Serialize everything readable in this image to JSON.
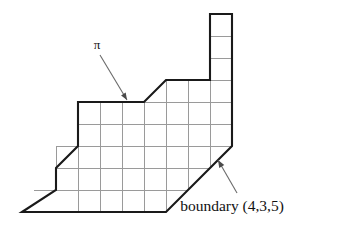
{
  "figure": {
    "background_color": "#ffffff",
    "grid_line_color": "#9a9a9a",
    "boundary_color": "#1a1a1a",
    "arrow_color": "#6a6a6a",
    "text_color": "#111111",
    "grid": {
      "cell_width": 22,
      "cell_height": 22,
      "origin_x": 56,
      "origin_y": 102
    },
    "labels": {
      "pi": "π",
      "boundary": "boundary (4,3,5)"
    },
    "annotations": [
      {
        "name": "pi-annotation",
        "text": "π",
        "text_x": 97,
        "text_y": 49,
        "arrow_from_x": 100,
        "arrow_from_y": 55,
        "arrow_to_x": 127,
        "arrow_to_y": 100
      },
      {
        "name": "boundary-annotation",
        "text": "boundary (4,3,5)",
        "text_x": 232,
        "text_y": 211,
        "arrow_from_x": 237,
        "arrow_from_y": 193,
        "arrow_to_x": 218,
        "arrow_to_y": 160
      }
    ],
    "boundary_polygon": [
      [
        22,
        212
      ],
      [
        56,
        190
      ],
      [
        56,
        168
      ],
      [
        78,
        146
      ],
      [
        78,
        102
      ],
      [
        144,
        102
      ],
      [
        166,
        80
      ],
      [
        210,
        80
      ],
      [
        210,
        14
      ],
      [
        232,
        14
      ],
      [
        232,
        146
      ],
      [
        166,
        212
      ],
      [
        22,
        212
      ]
    ],
    "grid_lines": [
      {
        "name": "h-row-0",
        "x1": 210,
        "y1": 14,
        "x2": 232,
        "y2": 14
      },
      {
        "name": "h-row-1",
        "x1": 210,
        "y1": 36,
        "x2": 232,
        "y2": 36
      },
      {
        "name": "h-row-2",
        "x1": 210,
        "y1": 58,
        "x2": 232,
        "y2": 58
      },
      {
        "name": "h-row-3",
        "x1": 166,
        "y1": 80,
        "x2": 232,
        "y2": 80
      },
      {
        "name": "h-row-4",
        "x1": 78,
        "y1": 102,
        "x2": 232,
        "y2": 102
      },
      {
        "name": "h-row-5",
        "x1": 78,
        "y1": 124,
        "x2": 232,
        "y2": 124
      },
      {
        "name": "h-row-6",
        "x1": 56,
        "y1": 146,
        "x2": 232,
        "y2": 146
      },
      {
        "name": "h-row-7",
        "x1": 56,
        "y1": 168,
        "x2": 210,
        "y2": 168
      },
      {
        "name": "h-row-8",
        "x1": 34,
        "y1": 190,
        "x2": 188,
        "y2": 190
      },
      {
        "name": "h-row-9",
        "x1": 22,
        "y1": 212,
        "x2": 166,
        "y2": 212
      },
      {
        "name": "v-col-0",
        "x1": 56,
        "y1": 146,
        "x2": 56,
        "y2": 190
      },
      {
        "name": "v-col-1",
        "x1": 78,
        "y1": 102,
        "x2": 78,
        "y2": 212
      },
      {
        "name": "v-col-2",
        "x1": 100,
        "y1": 102,
        "x2": 100,
        "y2": 212
      },
      {
        "name": "v-col-3",
        "x1": 122,
        "y1": 102,
        "x2": 122,
        "y2": 212
      },
      {
        "name": "v-col-4",
        "x1": 144,
        "y1": 102,
        "x2": 144,
        "y2": 212
      },
      {
        "name": "v-col-5",
        "x1": 166,
        "y1": 80,
        "x2": 166,
        "y2": 212
      },
      {
        "name": "v-col-6",
        "x1": 188,
        "y1": 80,
        "x2": 188,
        "y2": 190
      },
      {
        "name": "v-col-7",
        "x1": 210,
        "y1": 14,
        "x2": 210,
        "y2": 168
      },
      {
        "name": "v-col-8",
        "x1": 232,
        "y1": 14,
        "x2": 232,
        "y2": 146
      }
    ]
  }
}
